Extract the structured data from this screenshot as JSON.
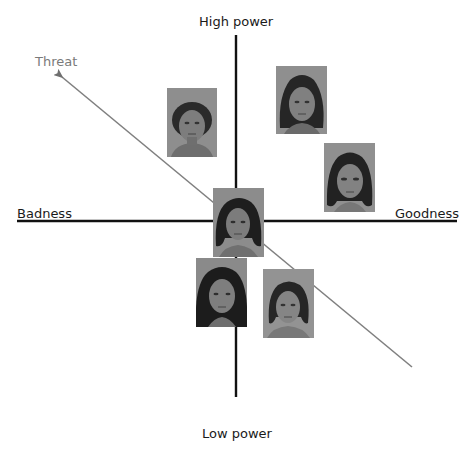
{
  "diagram": {
    "axes": {
      "vertical": {
        "top_label": "High power",
        "bottom_label": "Low power"
      },
      "horizontal": {
        "left_label": "Badness",
        "right_label": "Goodness"
      },
      "diagonal": {
        "label": "Threat",
        "color": "#808080"
      }
    },
    "faces": [
      {
        "id": "face-1",
        "description": "man, curly hair",
        "quadrant": "high-power-bad",
        "x": 167,
        "y": 88,
        "w": 50,
        "h": 69,
        "hair": "short-curly"
      },
      {
        "id": "face-2",
        "description": "woman, long dark hair",
        "quadrant": "high-power-good",
        "x": 276,
        "y": 66,
        "w": 51,
        "h": 68,
        "hair": "long"
      },
      {
        "id": "face-3",
        "description": "woman, shoulder-length dark hair",
        "quadrant": "good",
        "x": 324,
        "y": 143,
        "w": 51,
        "h": 69,
        "hair": "bob"
      },
      {
        "id": "face-4",
        "description": "man, wavy shoulder-length hair",
        "quadrant": "center",
        "x": 213,
        "y": 188,
        "w": 51,
        "h": 69,
        "hair": "wavy"
      },
      {
        "id": "face-5",
        "description": "woman, curly long hair",
        "quadrant": "low-power-bad",
        "x": 196,
        "y": 258,
        "w": 51,
        "h": 69,
        "hair": "curly-long"
      },
      {
        "id": "face-6",
        "description": "woman, shoulder-length hair",
        "quadrant": "low-power-good",
        "x": 263,
        "y": 269,
        "w": 51,
        "h": 69,
        "hair": "bob"
      }
    ],
    "colors": {
      "axis": "#111111",
      "threat_line": "#808080",
      "threat_label": "#7a7a7a",
      "photo_bg": "#8c8c8c"
    }
  }
}
